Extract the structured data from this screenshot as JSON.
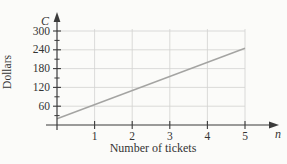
{
  "figure": {
    "bg_color": "#fbfbf9",
    "axis_color": "#3b3b3b",
    "grid_color": "#d2d2d0",
    "line_color": "#a4a4a2",
    "text_color": "#343434"
  },
  "chart_data": {
    "type": "line",
    "title": "",
    "xlabel": "Number of tickets",
    "ylabel": "Dollars",
    "x_axis_symbol": "n",
    "y_axis_symbol": "C",
    "x_ticks": [
      1,
      2,
      3,
      4,
      5
    ],
    "y_ticks": [
      60,
      120,
      180,
      240,
      300
    ],
    "y_minor_ticks": [
      30,
      90,
      150,
      210,
      270
    ],
    "xlim": [
      0,
      5.8
    ],
    "ylim": [
      0,
      330
    ],
    "grid": true,
    "legend": "none",
    "series": [
      {
        "name": "ticket-cost-line",
        "points": [
          [
            0,
            20
          ],
          [
            5,
            245
          ]
        ]
      }
    ]
  }
}
